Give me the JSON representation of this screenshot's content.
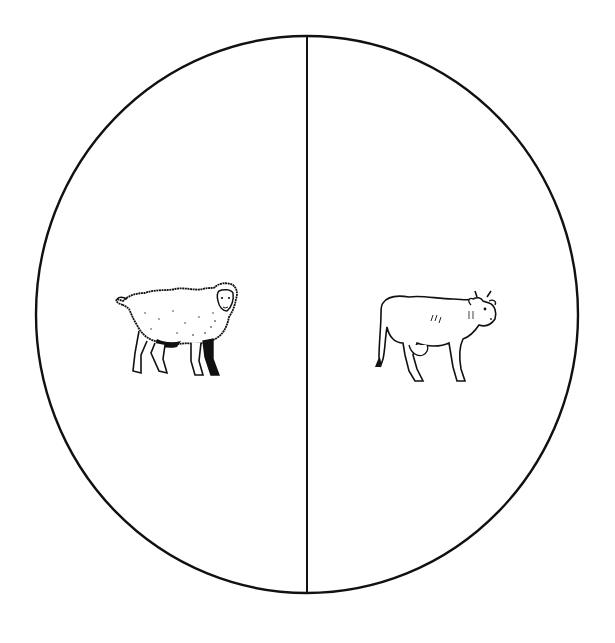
{
  "diagram": {
    "type": "two-part circle (sorting diagram)",
    "stroke_color": "#111111",
    "background": "#ffffff",
    "sections": [
      {
        "position": "left",
        "label": "sheep",
        "icon": "sheep-icon"
      },
      {
        "position": "right",
        "label": "cow",
        "icon": "cow-icon"
      }
    ]
  }
}
